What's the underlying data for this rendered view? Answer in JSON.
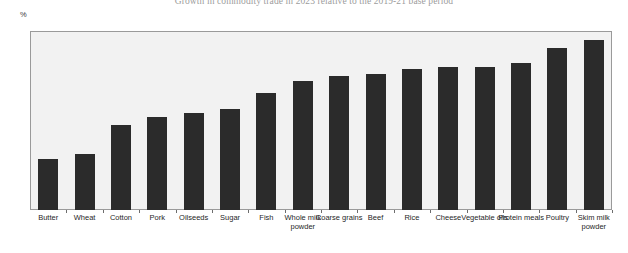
{
  "chart_data": {
    "type": "bar",
    "title": "Growth in commodity trade in 2023 relative to the 2019-21 base period",
    "xlabel": "",
    "ylabel": "%",
    "ylim": [
      0,
      35
    ],
    "yticks": [
      0,
      5,
      10,
      15,
      20,
      25,
      30,
      35
    ],
    "grid": false,
    "legend": "none",
    "bar_color": "#2b2b2b",
    "plot_background": "#f2f2f2",
    "categories": [
      "Butter",
      "Wheat",
      "Cotton",
      "Pork",
      "Oilseeds",
      "Sugar",
      "Fish",
      "Whole milk powder",
      "Coarse grains",
      "Beef",
      "Rice",
      "Cheese",
      "Vegetable oils",
      "Protein meals",
      "Poultry",
      "Skim milk powder"
    ],
    "values": [
      10.0,
      11.0,
      16.6,
      18.2,
      18.9,
      19.8,
      22.8,
      25.3,
      26.3,
      26.5,
      27.5,
      27.9,
      28.0,
      28.8,
      31.7,
      33.2
    ]
  }
}
